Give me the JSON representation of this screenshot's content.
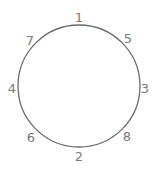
{
  "diagram": {
    "type": "circle-with-labels",
    "circle": {
      "cx": 79,
      "cy": 86,
      "r": 61,
      "stroke": "#6a6a6a",
      "stroke_width": 1.3
    },
    "label_color": "#7a7a7a",
    "labels": [
      {
        "text": "1",
        "position": "top",
        "x": 79,
        "y": 18
      },
      {
        "text": "5",
        "position": "top-right",
        "x": 128,
        "y": 39
      },
      {
        "text": "3",
        "position": "right",
        "x": 145,
        "y": 89
      },
      {
        "text": "8",
        "position": "bottom-right",
        "x": 127,
        "y": 137
      },
      {
        "text": "2",
        "position": "bottom",
        "x": 79,
        "y": 157
      },
      {
        "text": "6",
        "position": "bottom-left",
        "x": 31,
        "y": 138
      },
      {
        "text": "4",
        "position": "left",
        "x": 12,
        "y": 89
      },
      {
        "text": "7",
        "position": "top-left",
        "x": 30,
        "y": 41
      }
    ]
  }
}
